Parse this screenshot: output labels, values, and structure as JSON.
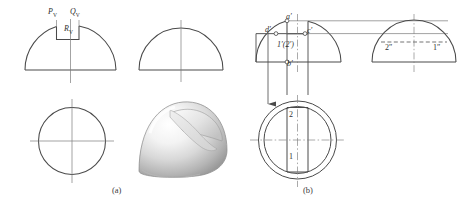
{
  "figure": {
    "background": "#ffffff",
    "line_color": "#4a4a4a",
    "thin_color": "#7b7b7b",
    "captions": [
      {
        "id": "cap-a",
        "text": "(a)",
        "x": 112,
        "y": 188
      },
      {
        "id": "cap-b",
        "text": "(b)",
        "x": 303,
        "y": 188
      }
    ]
  },
  "part_a": {
    "name": "orthographic-views-and-pictorial",
    "labels": [
      {
        "id": "label-pv",
        "base": "P",
        "sub": "V",
        "x": 48,
        "y": 10
      },
      {
        "id": "label-qv",
        "base": "Q",
        "sub": "V",
        "x": 70,
        "y": 10
      },
      {
        "id": "label-rv",
        "base": "R",
        "sub": "V",
        "x": 64,
        "y": 26
      }
    ],
    "views": [
      {
        "id": "front-view-notched",
        "type": "semicircle-with-notch"
      },
      {
        "id": "side-view-plain",
        "type": "semicircle"
      },
      {
        "id": "top-view-circle",
        "type": "circle-with-centerlines"
      },
      {
        "id": "pictorial-solid",
        "type": "shaded-dome-with-notch"
      }
    ]
  },
  "part_b": {
    "name": "projection-construction",
    "labels": [
      {
        "id": "label-a-prime",
        "text": "a′",
        "x": 290,
        "y": 23
      },
      {
        "id": "label-d-prime",
        "text": "d′",
        "x": 271,
        "y": 37
      },
      {
        "id": "label-c-prime",
        "text": "c′",
        "x": 308,
        "y": 38
      },
      {
        "id": "label-12-prime",
        "text": "1′(2′)",
        "x": 281,
        "y": 48
      },
      {
        "id": "label-b-prime",
        "text": "b′",
        "x": 291,
        "y": 67
      },
      {
        "id": "label-2-dblprime",
        "text": "2″",
        "x": 388,
        "y": 49
      },
      {
        "id": "label-1-dblprime",
        "text": "1″",
        "x": 436,
        "y": 49
      },
      {
        "id": "label-2-top",
        "text": "2",
        "x": 290,
        "y": 116
      },
      {
        "id": "label-1-top",
        "text": "1",
        "x": 290,
        "y": 158
      }
    ],
    "views": [
      {
        "id": "front-view-notched-b",
        "type": "semicircle-with-notch"
      },
      {
        "id": "side-view-b",
        "type": "semicircle-with-dashed-chord"
      },
      {
        "id": "top-view-b",
        "type": "double-circle-with-notch-rectangle"
      }
    ],
    "annotations": [
      {
        "id": "projection-arrow",
        "type": "arrow-down"
      },
      {
        "id": "projection-line-upper",
        "type": "horizontal-construction-line"
      },
      {
        "id": "projection-line-lower",
        "type": "horizontal-construction-line"
      }
    ]
  }
}
